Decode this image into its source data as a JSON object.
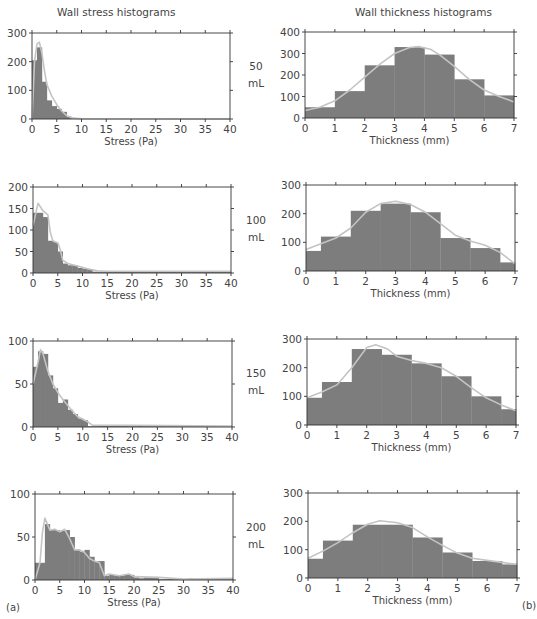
{
  "figure": {
    "left_title": "Wall stress histograms",
    "right_title": "Wall thickness histograms",
    "panel_a": "(a)",
    "panel_b": "(b)",
    "colors": {
      "bar": "#7d7d7d",
      "curve": "#c4c4c4",
      "axis": "#333333",
      "text": "#444444"
    }
  },
  "rows": [
    {
      "volume": "50",
      "unit": "mL"
    },
    {
      "volume": "100",
      "unit": "mL"
    },
    {
      "volume": "150",
      "unit": "mL"
    },
    {
      "volume": "200",
      "unit": "mL"
    }
  ],
  "chart_data": [
    {
      "type": "bar",
      "title": "Wall stress histograms — 50 mL",
      "xlabel": "Stress (Pa)",
      "ylabel": "",
      "xlim": [
        0,
        40
      ],
      "ylim": [
        0,
        300
      ],
      "xticks": [
        0,
        5,
        10,
        15,
        20,
        25,
        30,
        35,
        40
      ],
      "yticks": [
        0,
        100,
        200,
        300
      ],
      "bin_width": 1,
      "bins_x": [
        0,
        1,
        2,
        3,
        4,
        5,
        6,
        7,
        8
      ],
      "values": [
        205,
        250,
        130,
        65,
        45,
        35,
        25,
        8,
        2
      ],
      "curve": [
        [
          0,
          0
        ],
        [
          0.5,
          200
        ],
        [
          1,
          262
        ],
        [
          1.5,
          268
        ],
        [
          2,
          230
        ],
        [
          2.5,
          170
        ],
        [
          3,
          120
        ],
        [
          4,
          80
        ],
        [
          5,
          50
        ],
        [
          6,
          28
        ],
        [
          7,
          12
        ],
        [
          8,
          4
        ],
        [
          10,
          1
        ],
        [
          40,
          0
        ]
      ],
      "grid": false
    },
    {
      "type": "bar",
      "title": "Wall thickness histograms — 50 mL",
      "xlabel": "Thickness (mm)",
      "ylabel": "",
      "xlim": [
        0,
        7
      ],
      "ylim": [
        0,
        400
      ],
      "xticks": [
        0,
        1,
        2,
        3,
        4,
        5,
        6,
        7
      ],
      "yticks": [
        0,
        100,
        200,
        300,
        400
      ],
      "bin_edges": [
        0,
        1,
        2,
        3,
        4,
        5,
        6,
        7
      ],
      "values": [
        50,
        125,
        245,
        330,
        295,
        180,
        105
      ],
      "curve": [
        [
          0,
          35
        ],
        [
          0.5,
          50
        ],
        [
          1,
          80
        ],
        [
          1.5,
          130
        ],
        [
          2,
          190
        ],
        [
          2.5,
          250
        ],
        [
          3,
          300
        ],
        [
          3.5,
          328
        ],
        [
          3.8,
          332
        ],
        [
          4.2,
          320
        ],
        [
          4.5,
          295
        ],
        [
          5,
          240
        ],
        [
          5.5,
          180
        ],
        [
          6,
          130
        ],
        [
          6.5,
          100
        ],
        [
          7,
          75
        ]
      ],
      "grid": false
    },
    {
      "type": "bar",
      "title": "Wall stress histograms — 100 mL",
      "xlabel": "Stress (Pa)",
      "ylabel": "",
      "xlim": [
        0,
        40
      ],
      "ylim": [
        0,
        200
      ],
      "xticks": [
        0,
        5,
        10,
        15,
        20,
        25,
        30,
        35,
        40
      ],
      "yticks": [
        0,
        50,
        100,
        150,
        200
      ],
      "bin_width": 1,
      "bins_x": [
        0,
        1,
        2,
        3,
        4,
        5,
        6,
        7,
        8,
        9,
        10,
        11,
        12,
        13,
        14,
        15,
        16,
        17,
        18,
        19,
        20,
        21,
        22,
        23,
        24,
        25,
        26,
        27,
        28,
        29,
        30,
        31,
        32,
        33,
        34,
        35,
        36,
        37,
        38,
        39
      ],
      "values": [
        140,
        140,
        130,
        75,
        72,
        50,
        22,
        18,
        18,
        12,
        10,
        9,
        3,
        3,
        3,
        3,
        3,
        3,
        3,
        3,
        3,
        3,
        3,
        3,
        3,
        3,
        3,
        3,
        3,
        3,
        3,
        3,
        3,
        3,
        3,
        3,
        3,
        3,
        3,
        3
      ],
      "curve": [
        [
          0,
          110
        ],
        [
          1,
          162
        ],
        [
          2,
          145
        ],
        [
          3,
          135
        ],
        [
          3.5,
          95
        ],
        [
          4,
          75
        ],
        [
          5,
          70
        ],
        [
          5.5,
          55
        ],
        [
          6,
          30
        ],
        [
          7,
          22
        ],
        [
          9,
          16
        ],
        [
          11,
          10
        ],
        [
          13,
          5
        ],
        [
          15,
          4
        ],
        [
          40,
          4
        ]
      ],
      "grid": false
    },
    {
      "type": "bar",
      "title": "Wall thickness histograms — 100 mL",
      "xlabel": "Thickness (mm)",
      "ylabel": "",
      "xlim": [
        0,
        7
      ],
      "ylim": [
        0,
        300
      ],
      "xticks": [
        0,
        1,
        2,
        3,
        4,
        5,
        6,
        7
      ],
      "yticks": [
        0,
        100,
        200,
        300
      ],
      "bin_edges": [
        0,
        0.5,
        1.5,
        2.5,
        3.5,
        4.5,
        5.5,
        6.5,
        7
      ],
      "values": [
        70,
        120,
        210,
        235,
        205,
        115,
        80,
        30
      ],
      "curve": [
        [
          0,
          75
        ],
        [
          0.5,
          95
        ],
        [
          1,
          115
        ],
        [
          1.5,
          150
        ],
        [
          2,
          205
        ],
        [
          2.5,
          235
        ],
        [
          3,
          243
        ],
        [
          3.5,
          232
        ],
        [
          4,
          205
        ],
        [
          4.5,
          165
        ],
        [
          5,
          125
        ],
        [
          5.5,
          105
        ],
        [
          6,
          90
        ],
        [
          6.5,
          65
        ],
        [
          7,
          25
        ]
      ],
      "grid": false
    },
    {
      "type": "bar",
      "title": "Wall stress histograms — 150 mL",
      "xlabel": "Stress (Pa)",
      "ylabel": "",
      "xlim": [
        0,
        40
      ],
      "ylim": [
        0,
        100
      ],
      "xticks": [
        0,
        5,
        10,
        15,
        20,
        25,
        30,
        35,
        40
      ],
      "yticks": [
        0,
        50,
        100
      ],
      "bin_width": 1,
      "bins_x": [
        0,
        1,
        2,
        3,
        4,
        5,
        6,
        7,
        8,
        9,
        10,
        11,
        12,
        13,
        14,
        15,
        16,
        17,
        18,
        19,
        20,
        21,
        22,
        23,
        24,
        25,
        26,
        27,
        28,
        29,
        30,
        31,
        32,
        33,
        34,
        35,
        36,
        37,
        38,
        39
      ],
      "values": [
        70,
        88,
        85,
        60,
        45,
        28,
        32,
        20,
        15,
        10,
        8,
        1,
        1,
        2,
        2,
        2,
        2,
        2,
        2,
        1,
        1,
        2,
        1,
        1,
        1,
        1,
        1,
        1,
        1,
        1,
        1,
        1,
        1,
        1,
        1,
        1,
        1,
        1,
        1,
        1
      ],
      "curve": [
        [
          0,
          50
        ],
        [
          1,
          75
        ],
        [
          1.5,
          90
        ],
        [
          2,
          85
        ],
        [
          3,
          65
        ],
        [
          4,
          50
        ],
        [
          5,
          40
        ],
        [
          6,
          32
        ],
        [
          7,
          25
        ],
        [
          8,
          18
        ],
        [
          9,
          12
        ],
        [
          10,
          9
        ],
        [
          11,
          6
        ],
        [
          12,
          2
        ],
        [
          20,
          2
        ],
        [
          40,
          1
        ]
      ],
      "grid": false
    },
    {
      "type": "bar",
      "title": "Wall thickness histograms — 150 mL",
      "xlabel": "Thickness (mm)",
      "ylabel": "",
      "xlim": [
        0,
        7
      ],
      "ylim": [
        0,
        300
      ],
      "xticks": [
        0,
        1,
        2,
        3,
        4,
        5,
        6,
        7
      ],
      "yticks": [
        0,
        100,
        200,
        300
      ],
      "bin_edges": [
        0,
        0.5,
        1.5,
        2.5,
        3.5,
        4.5,
        5.5,
        6.5,
        7
      ],
      "values": [
        95,
        150,
        265,
        245,
        215,
        170,
        100,
        55
      ],
      "curve": [
        [
          0,
          95
        ],
        [
          0.5,
          115
        ],
        [
          1,
          140
        ],
        [
          1.5,
          200
        ],
        [
          2,
          270
        ],
        [
          2.3,
          280
        ],
        [
          2.7,
          265
        ],
        [
          3,
          240
        ],
        [
          3.5,
          225
        ],
        [
          4,
          215
        ],
        [
          4.5,
          200
        ],
        [
          5,
          170
        ],
        [
          5.5,
          130
        ],
        [
          6,
          95
        ],
        [
          6.5,
          70
        ],
        [
          7,
          50
        ]
      ],
      "grid": false
    },
    {
      "type": "bar",
      "title": "Wall stress histograms — 200 mL",
      "xlabel": "Stress (Pa)",
      "ylabel": "",
      "xlim": [
        0,
        40
      ],
      "ylim": [
        0,
        100
      ],
      "xticks": [
        0,
        5,
        10,
        15,
        20,
        25,
        30,
        35,
        40
      ],
      "yticks": [
        0,
        50,
        100
      ],
      "bin_width": 1,
      "bins_x": [
        0,
        1,
        2,
        3,
        4,
        5,
        6,
        7,
        8,
        9,
        10,
        11,
        12,
        13,
        14,
        15,
        16,
        17,
        18,
        19,
        20,
        21,
        22,
        23,
        24,
        25,
        26,
        27,
        28,
        29,
        30,
        31,
        32,
        33,
        34,
        35,
        36,
        37,
        38,
        39
      ],
      "values": [
        20,
        20,
        65,
        58,
        58,
        57,
        58,
        50,
        35,
        33,
        35,
        27,
        22,
        22,
        5,
        6,
        5,
        5,
        6,
        6,
        3,
        2,
        3,
        3,
        3,
        1,
        1,
        2,
        1,
        1,
        1,
        2,
        1,
        1,
        1,
        1,
        1,
        1,
        1,
        1
      ],
      "curve": [
        [
          0,
          0
        ],
        [
          1,
          20
        ],
        [
          1.5,
          55
        ],
        [
          2,
          72
        ],
        [
          2.5,
          65
        ],
        [
          3,
          58
        ],
        [
          4,
          59
        ],
        [
          5,
          56
        ],
        [
          6,
          59
        ],
        [
          7,
          48
        ],
        [
          8,
          35
        ],
        [
          9,
          35
        ],
        [
          10,
          32
        ],
        [
          11,
          25
        ],
        [
          12,
          22
        ],
        [
          13,
          20
        ],
        [
          14,
          5
        ],
        [
          15,
          7
        ],
        [
          17,
          5
        ],
        [
          19,
          7
        ],
        [
          20,
          4
        ],
        [
          25,
          3
        ],
        [
          30,
          1
        ],
        [
          40,
          2
        ]
      ],
      "grid": false
    },
    {
      "type": "bar",
      "title": "Wall thickness histograms — 200 mL",
      "xlabel": "Thickness (mm)",
      "ylabel": "",
      "xlim": [
        0,
        7
      ],
      "ylim": [
        0,
        300
      ],
      "xticks": [
        0,
        1,
        2,
        3,
        4,
        5,
        6,
        7
      ],
      "yticks": [
        0,
        100,
        200,
        300
      ],
      "bin_edges": [
        0,
        0.5,
        1.5,
        2.5,
        3.5,
        4.5,
        5.5,
        6.5,
        7
      ],
      "values": [
        68,
        132,
        188,
        188,
        143,
        90,
        60,
        48
      ],
      "curve": [
        [
          0,
          70
        ],
        [
          0.5,
          95
        ],
        [
          1,
          125
        ],
        [
          1.5,
          160
        ],
        [
          2,
          190
        ],
        [
          2.4,
          202
        ],
        [
          3,
          195
        ],
        [
          3.5,
          178
        ],
        [
          4,
          145
        ],
        [
          4.5,
          115
        ],
        [
          5,
          88
        ],
        [
          5.5,
          70
        ],
        [
          6,
          62
        ],
        [
          6.5,
          55
        ],
        [
          7,
          48
        ]
      ],
      "grid": false
    }
  ]
}
